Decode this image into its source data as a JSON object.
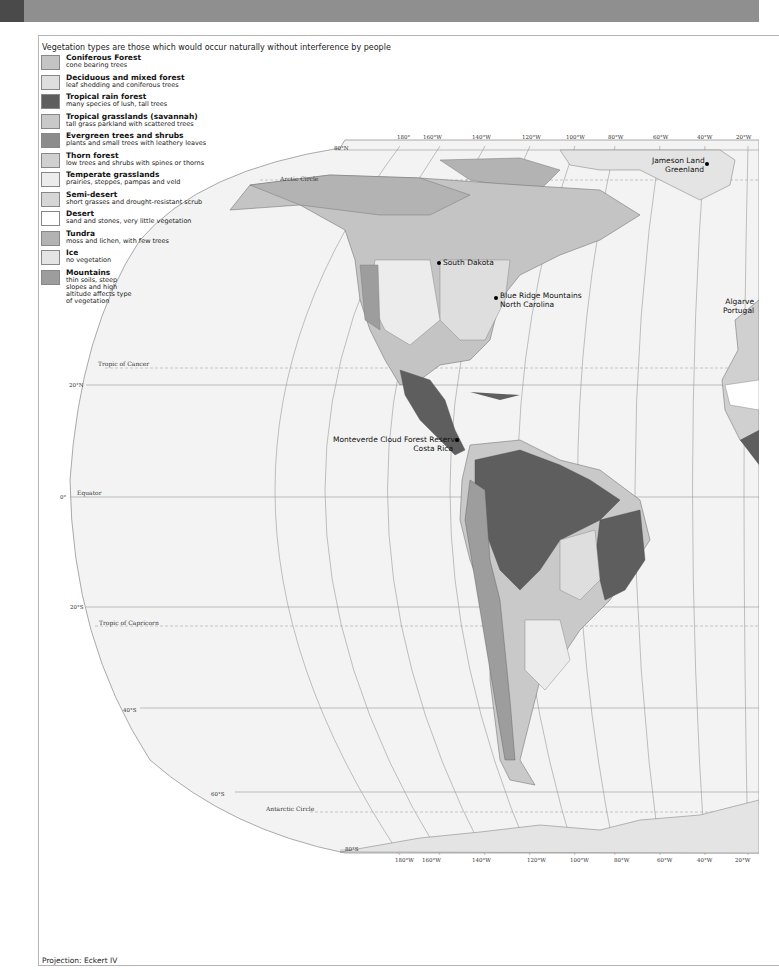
{
  "legend": {
    "title": "Vegetation types are those which would occur naturally without interference by people",
    "items": [
      {
        "name": "Coniferous Forest",
        "desc": "cone bearing trees",
        "color": "#c4c4c4"
      },
      {
        "name": "Deciduous and mixed forest",
        "desc": "leaf shedding and coniferous trees",
        "color": "#dedede"
      },
      {
        "name": "Tropical rain forest",
        "desc": "many species of lush, tall trees",
        "color": "#5e5e5e"
      },
      {
        "name": "Tropical grasslands (savannah)",
        "desc": "tall grass parkland with scattered trees",
        "color": "#c9c9c9"
      },
      {
        "name": "Evergreen trees and shrubs",
        "desc": "plants and small trees with leathery leaves",
        "color": "#8c8c8c"
      },
      {
        "name": "Thorn forest",
        "desc": "low trees and shrubs with spines or thorns",
        "color": "#d0d0d0"
      },
      {
        "name": "Temperate grasslands",
        "desc": "prairies, steppes, pampas and veld",
        "color": "#ececec"
      },
      {
        "name": "Semi-desert",
        "desc": "short grasses and drought-resistant scrub",
        "color": "#d6d6d6"
      },
      {
        "name": "Desert",
        "desc": "sand and stones, very little vegetation",
        "color": "#ffffff"
      },
      {
        "name": "Tundra",
        "desc": "moss and lichen, with few trees",
        "color": "#b3b3b3"
      },
      {
        "name": "Ice",
        "desc": "no vegetation",
        "color": "#e4e4e4"
      },
      {
        "name": "Mountains",
        "desc": "thin soils, steep slopes and high altitude affects type of vegetation",
        "color": "#9d9d9d"
      }
    ]
  },
  "map": {
    "locations": [
      {
        "label": "Jameson Land",
        "label2": "Greenland"
      },
      {
        "label": "South Dakota"
      },
      {
        "label": "Blue Ridge Mountains",
        "label2": "North Carolina"
      },
      {
        "label": "Algarve",
        "label2": "Portugal"
      },
      {
        "label": "Monteverde Cloud Forest Reserve",
        "label2": "Costa Rica"
      }
    ],
    "latitudes": {
      "n80": "80°N",
      "arctic": "Arctic Circle",
      "cancer": "Tropic of Cancer",
      "n20": "20°N",
      "eq0": "0°",
      "equator": "Equator",
      "s20": "20°S",
      "capricorn": "Tropic of Capricorn",
      "s40": "40°S",
      "s60": "60°S",
      "antarctic": "Antarctic Circle",
      "s80": "80°S"
    },
    "longitudes_top": [
      "180°",
      "160°W",
      "140°W",
      "120°W",
      "100°W",
      "80°W",
      "60°W",
      "40°W",
      "20°W"
    ],
    "longitudes_bottom": [
      "180°W",
      "160°W",
      "140°W",
      "120°W",
      "100°W",
      "80°W",
      "60°W",
      "40°W",
      "20°W"
    ]
  },
  "footer": {
    "projection": "Projection: Eckert IV"
  }
}
